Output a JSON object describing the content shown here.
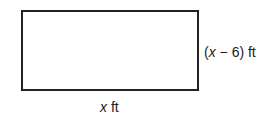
{
  "diagram": {
    "shape": "rectangle",
    "side_label": {
      "open_paren": "(",
      "variable": "x",
      "expression_rest": " − 6) ft"
    },
    "bottom_label": {
      "variable": "x",
      "unit": " ft"
    },
    "colors": {
      "stroke": "#222222",
      "background": "#ffffff"
    }
  }
}
